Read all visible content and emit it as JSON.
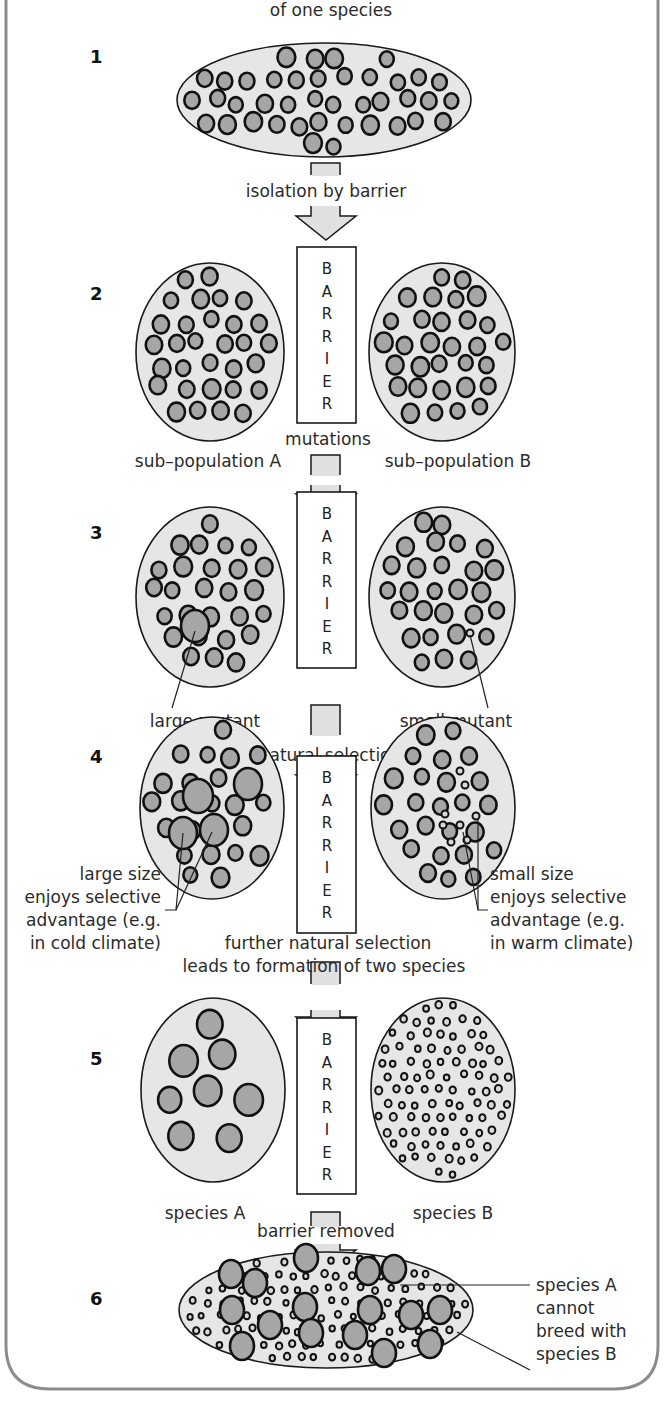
{
  "title": {
    "line2": "of one species"
  },
  "colors": {
    "frame": "#8c8c8c",
    "population_fill": "#e6e6e6",
    "organism_fill": "#a6a6a6",
    "arrow_fill": "#e0e0e0",
    "outline": "#111111"
  },
  "barrier_letters": [
    "B",
    "A",
    "R",
    "R",
    "I",
    "E",
    "R"
  ],
  "steps": [
    {
      "number": "1",
      "transition_label": "isolation by barrier"
    },
    {
      "number": "2",
      "label_left": "sub–population A",
      "label_right": "sub–population B",
      "transition_label": "mutations"
    },
    {
      "number": "3",
      "label_left": "large mutant",
      "label_right": "small mutant",
      "transition_label": "natural selection"
    },
    {
      "number": "4",
      "label_left": [
        "large size",
        "enjoys selective",
        "advantage (e.g.",
        "in cold climate)"
      ],
      "label_right": [
        "small size",
        "enjoys selective",
        "advantage (e.g.",
        "in warm climate)"
      ],
      "transition_label": [
        "further natural selection",
        "leads to formation of two species"
      ]
    },
    {
      "number": "5",
      "label_left": "species A",
      "label_right": "species B",
      "transition_label": "barrier removed"
    },
    {
      "number": "6",
      "label_right": [
        "species A",
        "cannot",
        "breed with",
        "species B"
      ]
    }
  ]
}
